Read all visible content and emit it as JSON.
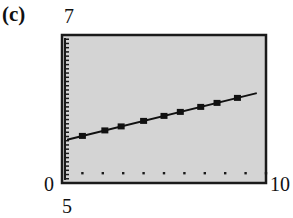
{
  "panel_label": "(c)",
  "axis_labels": {
    "y_max": "7",
    "y_min": "0",
    "x_max": "10",
    "x_scale": "5"
  },
  "colors": {
    "screen_bg": "#d4d4d4",
    "frame": "#1a1a1a",
    "line": "#111111"
  },
  "chart_data": {
    "type": "scatter",
    "title": "(c)",
    "xlabel": "",
    "ylabel": "",
    "xlim": [
      0,
      10
    ],
    "ylim": [
      0,
      7
    ],
    "grid": false,
    "x_ticks": [
      1,
      2,
      3,
      4,
      5,
      6,
      7,
      8,
      9,
      10
    ],
    "y_tick_spacing": 0.2,
    "annotations": [
      "7",
      "0",
      "10",
      "5"
    ],
    "series": [
      {
        "name": "data points",
        "marker": "square",
        "x": [
          1.0,
          2.1,
          2.9,
          4.0,
          5.0,
          5.8,
          6.8,
          7.6,
          8.6
        ],
        "y": [
          2.25,
          2.5,
          2.7,
          2.95,
          3.2,
          3.35,
          3.6,
          3.75,
          4.0
        ]
      },
      {
        "name": "regression line",
        "type": "line",
        "x": [
          0.25,
          9.55
        ],
        "y": [
          2.05,
          4.25
        ]
      }
    ]
  }
}
